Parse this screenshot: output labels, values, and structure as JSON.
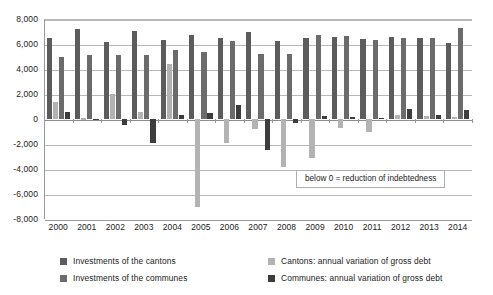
{
  "chart_data": {
    "type": "bar",
    "title": "",
    "subtitle": "",
    "xlabel": "",
    "ylabel": "",
    "categories": [
      "2000",
      "2001",
      "2002",
      "2003",
      "2004",
      "2005",
      "2006",
      "2007",
      "2008",
      "2009",
      "2010",
      "2011",
      "2012",
      "2013",
      "2014"
    ],
    "ylim": [
      -8000,
      8000
    ],
    "ytick_values": [
      8000,
      6000,
      4000,
      2000,
      0,
      -2000,
      -4000,
      -6000,
      -8000
    ],
    "ytick_labels": [
      "8,000",
      "6,000",
      "4,000",
      "2,000",
      "0",
      "-2,000",
      "-4,000",
      "-6,000",
      "-8,000"
    ],
    "grid": true,
    "legend_position": "bottom",
    "annotations": [
      {
        "text": "below 0 = reduction of indebtedness"
      }
    ],
    "series": [
      {
        "name": "Investments of the cantons",
        "color": "#5c5c5c",
        "values": [
          6450,
          7200,
          6200,
          7050,
          6350,
          6700,
          6450,
          7000,
          6250,
          6500,
          6600,
          6400,
          6550,
          6500,
          6100
        ]
      },
      {
        "name": "Cantons: annual variation of gross debt",
        "color": "#b3b3b3",
        "values": [
          1400,
          50,
          2000,
          600,
          4400,
          -7050,
          -1950,
          -800,
          -3800,
          -3150,
          -700,
          -1000,
          300,
          250,
          200
        ]
      },
      {
        "name": "Investments of the communes",
        "color": "#6b6b6b",
        "values": [
          4950,
          5100,
          5150,
          5150,
          5550,
          5350,
          6250,
          5200,
          5200,
          6750,
          6650,
          6350,
          6500,
          6500,
          7300
        ]
      },
      {
        "name": "Communes: annual variation of gross debt",
        "color": "#3d3d3d",
        "values": [
          550,
          30,
          -500,
          -1950,
          350,
          450,
          1100,
          -2450,
          -300,
          250,
          200,
          100,
          800,
          350,
          750
        ]
      }
    ]
  },
  "legend": {
    "items": [
      {
        "label": "Investments of the cantons",
        "color": "#5c5c5c"
      },
      {
        "label": "Investments of the communes",
        "color": "#6b6b6b"
      },
      {
        "label": "Cantons: annual variation of gross debt",
        "color": "#b3b3b3"
      },
      {
        "label": "Communes: annual variation of gross debt",
        "color": "#3d3d3d"
      }
    ]
  },
  "annotation": {
    "text": "below 0 = reduction of indebtedness"
  }
}
